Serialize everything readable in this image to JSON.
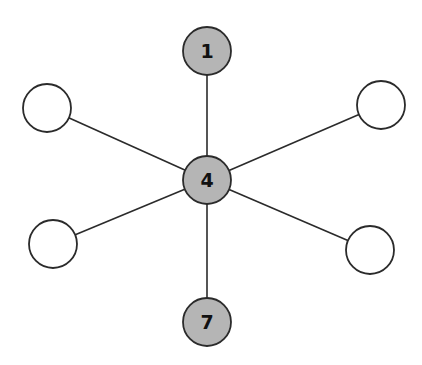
{
  "diagram": {
    "type": "star-graph",
    "colors": {
      "filled": "#b5b5b5",
      "empty": "#ffffff",
      "stroke": "#2b2b2b"
    },
    "nodes": [
      {
        "id": "top",
        "label": "1",
        "filled": true
      },
      {
        "id": "center",
        "label": "4",
        "filled": true
      },
      {
        "id": "bottom",
        "label": "7",
        "filled": true
      },
      {
        "id": "upper-left",
        "label": "",
        "filled": false
      },
      {
        "id": "upper-right",
        "label": "",
        "filled": false
      },
      {
        "id": "lower-left",
        "label": "",
        "filled": false
      },
      {
        "id": "lower-right",
        "label": "",
        "filled": false
      }
    ],
    "edges": [
      [
        "center",
        "top"
      ],
      [
        "center",
        "bottom"
      ],
      [
        "center",
        "upper-left"
      ],
      [
        "center",
        "upper-right"
      ],
      [
        "center",
        "lower-left"
      ],
      [
        "center",
        "lower-right"
      ]
    ]
  }
}
